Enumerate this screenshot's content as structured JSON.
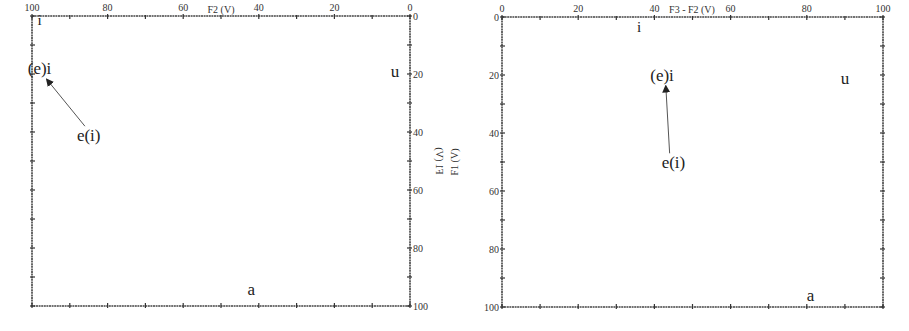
{
  "chart_data": [
    {
      "type": "scatter",
      "title": "",
      "xlabel": "F2 (V)",
      "ylabel": "F1 (V)",
      "xlim": [
        100,
        0
      ],
      "ylim": [
        0,
        100
      ],
      "x_axis_position": "top",
      "y_axis_position": "right",
      "x_reversed": true,
      "y_reversed": true,
      "x_ticks": [
        100,
        80,
        60,
        40,
        20,
        0
      ],
      "y_ticks": [
        0,
        20,
        40,
        60,
        80,
        100
      ],
      "x_tick_labels": [
        "100",
        "80",
        "60",
        "40",
        "20",
        "0"
      ],
      "y_tick_labels": [
        "0",
        "20",
        "40",
        "60",
        "80",
        "100"
      ],
      "grid": false,
      "points": [
        {
          "label": "i",
          "x": 98,
          "y": 1
        },
        {
          "label": "(e)i",
          "x": 98,
          "y": 18
        },
        {
          "label": "u",
          "x": 4,
          "y": 19
        },
        {
          "label": "a",
          "x": 42,
          "y": 94
        },
        {
          "label": "e(i)",
          "x": 85,
          "y": 41
        }
      ],
      "annotations": [
        {
          "type": "arrow",
          "from_label": "e(i)",
          "to_label": "(e)i",
          "from": [
            86,
            38
          ],
          "to": [
            96,
            22
          ]
        }
      ]
    },
    {
      "type": "scatter",
      "title": "",
      "xlabel": "F3 - F2 (V)",
      "ylabel": "F1 (V)",
      "xlim": [
        0,
        100
      ],
      "ylim": [
        0,
        100
      ],
      "x_axis_position": "top",
      "y_axis_position": "left",
      "x_reversed": false,
      "y_reversed": true,
      "x_ticks": [
        0,
        20,
        40,
        60,
        80,
        100
      ],
      "y_ticks": [
        0,
        20,
        40,
        60,
        80,
        100
      ],
      "x_tick_labels": [
        "0",
        "20",
        "40",
        "60",
        "80",
        "100"
      ],
      "y_tick_labels": [
        "0",
        "20",
        "40",
        "60",
        "80",
        "100"
      ],
      "grid": false,
      "points": [
        {
          "label": "i",
          "x": 36,
          "y": 3
        },
        {
          "label": "(e)i",
          "x": 42,
          "y": 20
        },
        {
          "label": "u",
          "x": 90,
          "y": 21
        },
        {
          "label": "a",
          "x": 81,
          "y": 96
        },
        {
          "label": "e(i)",
          "x": 45,
          "y": 50
        }
      ],
      "annotations": [
        {
          "type": "arrow",
          "from_label": "e(i)",
          "to_label": "(e)i",
          "from": [
            44,
            47
          ],
          "to": [
            43,
            24
          ]
        }
      ]
    }
  ]
}
